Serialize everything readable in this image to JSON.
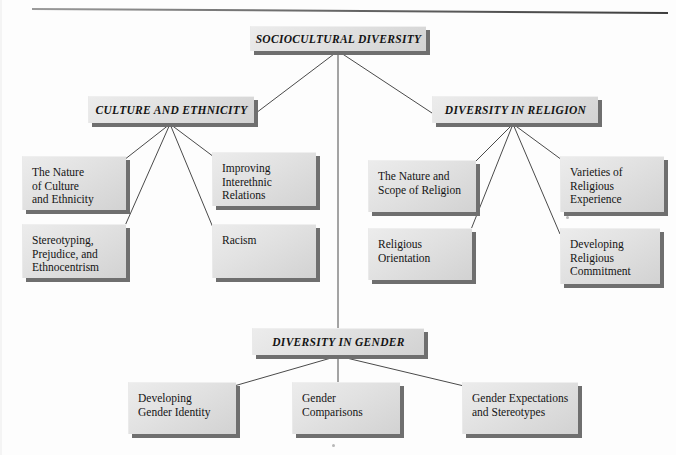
{
  "diagram": {
    "type": "hierarchy-tree",
    "root": {
      "id": "sociocultural-diversity",
      "label": "SOCIOCULTURAL DIVERSITY",
      "style": "italic-caps"
    },
    "branches": [
      {
        "id": "culture-and-ethnicity",
        "label": "CULTURE AND ETHNICITY",
        "style": "italic-caps",
        "children": [
          {
            "id": "nature-of-culture-and-ethnicity",
            "label": "The Nature\nof Culture\nand Ethnicity"
          },
          {
            "id": "improving-interethnic-relations",
            "label": "Improving\nInterethnic\nRelations"
          },
          {
            "id": "stereotyping-prejudice-ethnocentrism",
            "label": "Stereotyping,\nPrejudice, and\nEthnocentrism"
          },
          {
            "id": "racism",
            "label": "Racism"
          }
        ]
      },
      {
        "id": "diversity-in-religion",
        "label": "DIVERSITY IN RELIGION",
        "style": "italic-caps",
        "children": [
          {
            "id": "nature-and-scope-of-religion",
            "label": "The Nature and\nScope of Religion"
          },
          {
            "id": "varieties-of-religious-experience",
            "label": "Varieties of\nReligious\nExperience"
          },
          {
            "id": "religious-orientation",
            "label": "Religious\nOrientation"
          },
          {
            "id": "developing-religious-commitment",
            "label": "Developing\nReligious\nCommitment"
          }
        ]
      },
      {
        "id": "diversity-in-gender",
        "label": "DIVERSITY IN GENDER",
        "style": "italic-caps",
        "children": [
          {
            "id": "developing-gender-identity",
            "label": "Developing\nGender Identity"
          },
          {
            "id": "gender-comparisons",
            "label": "Gender\nComparisons"
          },
          {
            "id": "gender-expectations-and-stereotypes",
            "label": "Gender Expectations\nand Stereotypes"
          }
        ]
      }
    ],
    "colors": {
      "box_fill_light": "#ececec",
      "box_fill_dark": "#d2d2d2",
      "box_shadow": "#6f6f6f",
      "connector": "#4a4a4a",
      "text": "#141414",
      "page_background": "#fdfdfd"
    }
  }
}
